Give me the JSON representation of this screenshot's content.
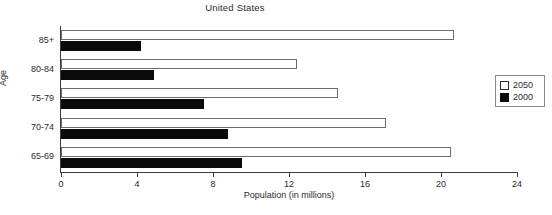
{
  "chart_data": {
    "type": "bar",
    "orientation": "horizontal",
    "title": "United States",
    "xlabel": "Population (in millions)",
    "ylabel": "Age",
    "categories": [
      "65-69",
      "70-74",
      "75-79",
      "80-84",
      "85+"
    ],
    "series": [
      {
        "name": "2050",
        "values": [
          20.5,
          17.1,
          14.6,
          12.4,
          20.7
        ],
        "color": "#ffffff"
      },
      {
        "name": "2000",
        "values": [
          9.5,
          8.8,
          7.5,
          4.9,
          4.2
        ],
        "color": "#000000"
      }
    ],
    "xlim": [
      0,
      24
    ],
    "xticks": [
      0,
      4,
      8,
      12,
      16,
      20,
      24
    ],
    "xtick_labels": [
      "0",
      "4",
      "8",
      "12",
      "16",
      "20",
      "24"
    ],
    "grid": false,
    "legend_position": "right"
  },
  "legend": {
    "entries": [
      {
        "label": "2050",
        "swatch": "white-square"
      },
      {
        "label": "2000",
        "swatch": "black-square"
      }
    ]
  }
}
